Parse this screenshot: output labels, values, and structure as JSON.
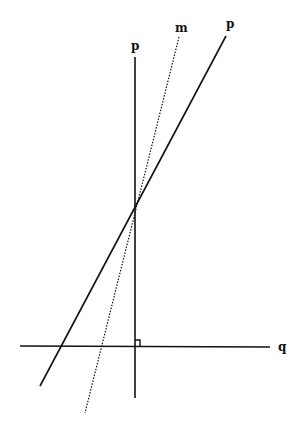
{
  "diagram": {
    "type": "geometry-lines",
    "labels": {
      "vertical_line": "p",
      "dotted_line": "m",
      "slanted_line": "p",
      "horizontal_line": "q"
    },
    "features": {
      "right_angle_marker": "between vertical line p and horizontal line q",
      "intersection_point": "lines p, m and slanted p meet at one point"
    },
    "colors": {
      "line": "#111111",
      "background": "#ffffff"
    }
  }
}
